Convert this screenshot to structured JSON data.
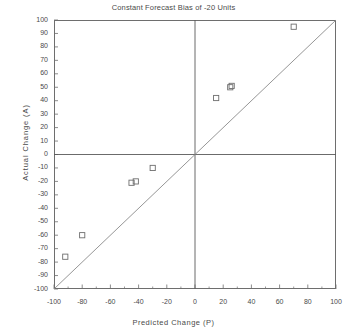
{
  "chart_data": {
    "type": "scatter",
    "title": "Constant Forecast Bias of -20 Units",
    "xlabel": "Predicted Change (P)",
    "ylabel": "Actual Change (A)",
    "xlim": [
      -100,
      100
    ],
    "ylim": [
      -100,
      100
    ],
    "grid": false,
    "legend": null,
    "x_major_ticks": [
      -100,
      -80,
      -60,
      -40,
      -20,
      0,
      20,
      40,
      60,
      80,
      100
    ],
    "x_major_tick_labels": [
      "-100",
      "-80",
      "-60",
      "-40",
      "-20",
      "0",
      "20",
      "40",
      "60",
      "80",
      "100"
    ],
    "x_minor_tick_step": 10,
    "y_major_ticks": [
      -100,
      -90,
      -80,
      -70,
      -60,
      -50,
      -40,
      -30,
      -20,
      -10,
      0,
      10,
      20,
      30,
      40,
      50,
      60,
      70,
      80,
      90,
      100
    ],
    "y_major_tick_labels": [
      "-100",
      "-90",
      "-80",
      "-70",
      "-60",
      "-50",
      "-40",
      "-30",
      "-20",
      "-10",
      "0",
      "10",
      "20",
      "30",
      "40",
      "50",
      "60",
      "70",
      "80",
      "90",
      "100"
    ],
    "marker": "open-square",
    "marker_color": "#6e6e6e",
    "points": [
      {
        "x": -92,
        "y": -76
      },
      {
        "x": -80,
        "y": -60
      },
      {
        "x": -45,
        "y": -21
      },
      {
        "x": -42,
        "y": -20
      },
      {
        "x": -30,
        "y": -10
      },
      {
        "x": 15,
        "y": 42
      },
      {
        "x": 25,
        "y": 50
      },
      {
        "x": 26,
        "y": 51
      },
      {
        "x": 70,
        "y": 95
      }
    ],
    "reference_line": {
      "name": "identity-line",
      "from": [
        -100,
        -100
      ],
      "to": [
        100,
        100
      ],
      "color": "#8a8a8a"
    },
    "zero_lines": {
      "name": "zero-crosshair",
      "x": 0,
      "y": 0,
      "color": "#5a5a5a"
    },
    "frame_color": "#6e6e6e"
  }
}
